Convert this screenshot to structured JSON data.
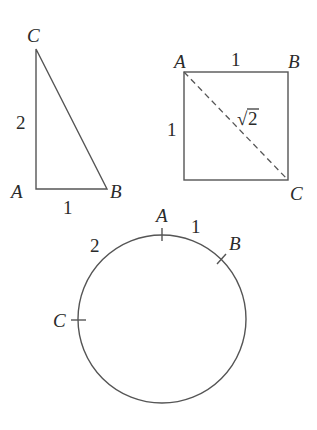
{
  "triangle": {
    "vertices": {
      "A": "A",
      "B": "B",
      "C": "C"
    },
    "side_AC": "2",
    "side_AB": "1"
  },
  "square": {
    "vertices": {
      "A": "A",
      "B": "B",
      "C": "C"
    },
    "side_AB": "1",
    "side_left": "1",
    "diagonal": "2",
    "diagonal_prefix": "√"
  },
  "circle": {
    "points": {
      "A": "A",
      "B": "B",
      "C": "C"
    },
    "arc_AB": "1",
    "arc_CA": "2"
  }
}
